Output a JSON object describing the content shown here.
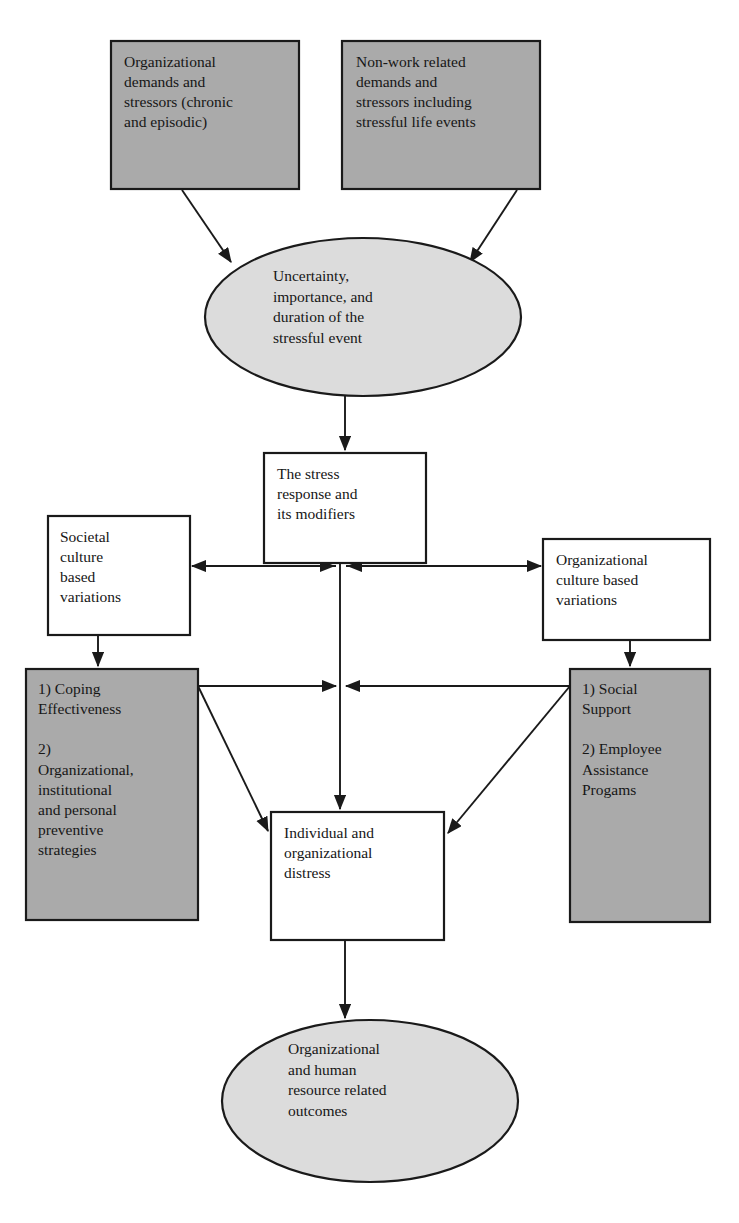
{
  "diagram": {
    "colors": {
      "gray_fill": "#aaaaaa",
      "ellipse_fill": "#dcdcdc",
      "white_fill": "#ffffff",
      "stroke": "#1a1a1a",
      "text": "#161616",
      "background": "#ffffff"
    },
    "nodes": [
      {
        "id": "organizational-demands",
        "shape": "rectangle",
        "fill": "gray",
        "text": "Organizational\ndemands and\nstressors (chronic\nand episodic)",
        "x": 111,
        "y": 41,
        "w": 188,
        "h": 148
      },
      {
        "id": "non-work-demands",
        "shape": "rectangle",
        "fill": "gray",
        "text": "Non-work related\ndemands and\nstressors including\nstressful life events",
        "x": 342,
        "y": 41,
        "w": 198,
        "h": 148
      },
      {
        "id": "uncertainty-ellipse",
        "shape": "ellipse",
        "fill": "gray-light",
        "text": "Uncertainty,\nimportance, and\nduration of the\nstressful event",
        "x": 205,
        "y": 238,
        "w": 316,
        "h": 158
      },
      {
        "id": "stress-response",
        "shape": "rectangle",
        "fill": "white",
        "text": "The stress\nresponse and\nits modifiers",
        "x": 264,
        "y": 453,
        "w": 162,
        "h": 110
      },
      {
        "id": "societal-culture",
        "shape": "rectangle",
        "fill": "white",
        "text": "Societal\nculture\nbased\nvariations",
        "x": 48,
        "y": 516,
        "w": 142,
        "h": 119
      },
      {
        "id": "organizational-culture",
        "shape": "rectangle",
        "fill": "white",
        "text": "Organizational\nculture based\nvariations",
        "x": 543,
        "y": 539,
        "w": 167,
        "h": 101
      },
      {
        "id": "coping-effectiveness",
        "shape": "rectangle",
        "fill": "gray",
        "text": "1) Coping\nEffectiveness\n\n2)\nOrganizational,\ninstitutional\nand personal\npreventive\nstrategies",
        "x": 26,
        "y": 669,
        "w": 172,
        "h": 251
      },
      {
        "id": "social-support",
        "shape": "rectangle",
        "fill": "gray",
        "text": "1) Social\nSupport\n\n2) Employee\nAssistance\nProgams",
        "x": 570,
        "y": 669,
        "w": 140,
        "h": 253
      },
      {
        "id": "individual-distress",
        "shape": "rectangle",
        "fill": "white",
        "text": "Individual and\norganizational\ndistress",
        "x": 271,
        "y": 812,
        "w": 173,
        "h": 128
      },
      {
        "id": "outcomes-ellipse",
        "shape": "ellipse",
        "fill": "gray-light",
        "text": "Organizational\nand human\nresource related\noutcomes",
        "x": 222,
        "y": 1020,
        "w": 296,
        "h": 163
      }
    ],
    "node_labels": {
      "organizational_demands": "Organizational\ndemands and\nstressors (chronic\nand episodic)",
      "non_work_demands": "Non-work related\ndemands and\nstressors including\nstressful life events",
      "uncertainty": "Uncertainty,\nimportance, and\nduration of the\nstressful event",
      "stress_response": "The stress\nresponse and\nits modifiers",
      "societal_culture": "Societal\nculture\nbased\nvariations",
      "organizational_culture": "Organizational\nculture based\nvariations",
      "coping_effectiveness": "1) Coping\nEffectiveness\n\n2)\nOrganizational,\ninstitutional\nand personal\npreventive\nstrategies",
      "social_support": "1) Social\nSupport\n\n2) Employee\nAssistance\nProgams",
      "individual_distress": "Individual and\norganizational\ndistress",
      "outcomes": "Organizational\nand human\nresource related\noutcomes"
    },
    "edges": [
      {
        "id": "edge-orgdemands-to-uncertainty",
        "from": "organizational-demands",
        "to": "uncertainty-ellipse",
        "style": "solid",
        "arrow": "single"
      },
      {
        "id": "edge-nonwork-to-uncertainty",
        "from": "non-work-demands",
        "to": "uncertainty-ellipse",
        "style": "solid",
        "arrow": "single"
      },
      {
        "id": "edge-uncertainty-to-stress",
        "from": "uncertainty-ellipse",
        "to": "stress-response",
        "style": "solid",
        "arrow": "single"
      },
      {
        "id": "edge-stress-to-societal",
        "from": "stress-response",
        "to": "societal-culture",
        "style": "solid",
        "arrow": "double"
      },
      {
        "id": "edge-stress-to-orgculture",
        "from": "stress-response",
        "to": "organizational-culture",
        "style": "solid",
        "arrow": "double"
      },
      {
        "id": "edge-societal-to-coping",
        "from": "societal-culture",
        "to": "coping-effectiveness",
        "style": "solid",
        "arrow": "single"
      },
      {
        "id": "edge-orgculture-to-social",
        "from": "organizational-culture",
        "to": "social-support",
        "style": "solid",
        "arrow": "single"
      },
      {
        "id": "edge-coping-to-center",
        "from": "coping-effectiveness",
        "to": "center-axis",
        "style": "solid",
        "arrow": "single"
      },
      {
        "id": "edge-social-to-center",
        "from": "social-support",
        "to": "center-axis",
        "style": "solid",
        "arrow": "single"
      },
      {
        "id": "edge-coping-to-distress",
        "from": "coping-effectiveness",
        "to": "individual-distress",
        "style": "solid",
        "arrow": "single"
      },
      {
        "id": "edge-social-to-distress",
        "from": "social-support",
        "to": "individual-distress",
        "style": "solid",
        "arrow": "single"
      },
      {
        "id": "edge-stress-to-distress",
        "from": "stress-response",
        "to": "individual-distress",
        "style": "solid",
        "arrow": "single"
      },
      {
        "id": "edge-distress-to-outcomes",
        "from": "individual-distress",
        "to": "outcomes-ellipse",
        "style": "solid",
        "arrow": "single"
      }
    ]
  }
}
